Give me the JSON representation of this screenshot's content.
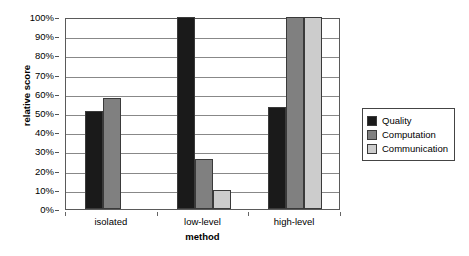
{
  "chart_data": {
    "type": "bar",
    "title": "",
    "xlabel": "method",
    "ylabel": "relative score",
    "categories": [
      "isolated",
      "low-level",
      "high-level"
    ],
    "series": [
      {
        "name": "Quality",
        "color": "#1a1a1a",
        "values": [
          51,
          100,
          53
        ]
      },
      {
        "name": "Computation",
        "color": "#808080",
        "values": [
          58,
          26,
          100
        ]
      },
      {
        "name": "Communication",
        "color": "#cccccc",
        "values": [
          0,
          10,
          100
        ]
      }
    ],
    "ylim": [
      0,
      100
    ],
    "ytick_labels": [
      "0%",
      "10%",
      "20%",
      "30%",
      "40%",
      "50%",
      "60%",
      "70%",
      "80%",
      "90%",
      "100%"
    ],
    "ytick_values": [
      0,
      10,
      20,
      30,
      40,
      50,
      60,
      70,
      80,
      90,
      100
    ],
    "grid": "horizontal",
    "legend_position": "right"
  }
}
